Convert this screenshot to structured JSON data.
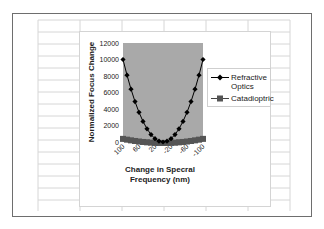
{
  "chart_data": {
    "type": "line",
    "title": "",
    "xlabel": "Change in Specral Frequency (nm)",
    "ylabel": "Normalized Focus Change",
    "ylim": [
      0,
      12000
    ],
    "y_ticks": [
      "0",
      "2000",
      "4000",
      "6000",
      "8000",
      "10000",
      "12000"
    ],
    "x_tick_labels": [
      "100",
      "60",
      "20",
      "-20",
      "-60",
      "-100"
    ],
    "x": [
      100,
      90,
      80,
      70,
      60,
      50,
      40,
      30,
      20,
      10,
      0,
      -10,
      -20,
      -30,
      -40,
      -50,
      -60,
      -70,
      -80,
      -90,
      -100
    ],
    "series": [
      {
        "name": "Refractive Optics",
        "marker": "diamond",
        "color": "#000000",
        "values": [
          10000,
          8100,
          6400,
          4900,
          3600,
          2500,
          1600,
          900,
          400,
          100,
          0,
          100,
          400,
          900,
          1600,
          2500,
          3600,
          4900,
          6400,
          8100,
          10000
        ]
      },
      {
        "name": "Catadioptric",
        "marker": "square",
        "color": "#555555",
        "values": [
          500,
          405,
          320,
          245,
          180,
          125,
          80,
          45,
          20,
          5,
          0,
          5,
          20,
          45,
          80,
          125,
          180,
          245,
          320,
          405,
          500
        ]
      }
    ],
    "plot_background": "#a9a9a9",
    "grid": false,
    "legend_position": "right"
  },
  "legend": {
    "items": [
      {
        "label_line1": "Refractive",
        "label_line2": "Optics"
      },
      {
        "label_line1": "Catadioptric",
        "label_line2": ""
      }
    ]
  },
  "axes": {
    "xlabel_line1": "Change in Specral",
    "xlabel_line2": "Frequency (nm)",
    "ylabel": "Normalized Focus Change"
  }
}
